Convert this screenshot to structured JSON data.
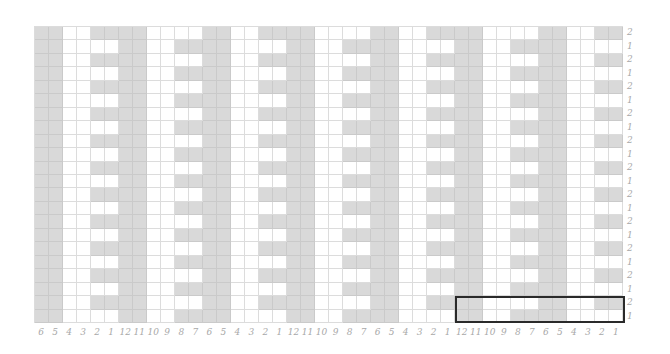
{
  "chart_data": {
    "type": "table",
    "title": "",
    "columns": 42,
    "rows": 22,
    "column_labels": [
      "6",
      "5",
      "4",
      "3",
      "2",
      "1",
      "12",
      "11",
      "10",
      "9",
      "8",
      "7",
      "6",
      "5",
      "4",
      "3",
      "2",
      "1",
      "12",
      "11",
      "10",
      "9",
      "8",
      "7",
      "6",
      "5",
      "4",
      "3",
      "2",
      "1",
      "12",
      "11",
      "10",
      "9",
      "8",
      "7",
      "6",
      "5",
      "4",
      "3",
      "2",
      "1"
    ],
    "row_labels_top_to_bottom": [
      "2",
      "1",
      "2",
      "1",
      "2",
      "1",
      "2",
      "1",
      "2",
      "1",
      "2",
      "1",
      "2",
      "1",
      "2",
      "1",
      "2",
      "1",
      "2",
      "1",
      "2",
      "1"
    ],
    "repeat": {
      "stitches": 12,
      "rows": 2,
      "pattern_by_stitch_12_to_1": {
        "row_2": [
          "G",
          "G",
          "W",
          "W",
          "W",
          "W",
          "G",
          "G",
          "W",
          "W",
          "G",
          "G"
        ],
        "row_1": [
          "G",
          "G",
          "W",
          "W",
          "G",
          "G",
          "G",
          "G",
          "W",
          "W",
          "W",
          "W"
        ]
      },
      "legend": {
        "G": "shaded (#d9d9d9)",
        "W": "blank (#ffffff)"
      }
    },
    "highlight_box": {
      "columns": "last 12 (12..1)",
      "rows": "bottom 2 (2,1)"
    }
  },
  "colors": {
    "shaded": "#d9d9d9",
    "blank": "#ffffff",
    "grid_line": "#dcdcdc",
    "label": "#a8a8a8",
    "highlight_border": "#2a2a2a"
  }
}
